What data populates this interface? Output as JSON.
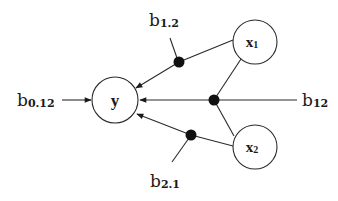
{
  "diagram": {
    "type": "path-diagram",
    "nodes": [
      {
        "id": "y",
        "label": "y",
        "cx": 115,
        "cy": 100,
        "r": 23
      },
      {
        "id": "x1",
        "label": "x",
        "sub": "1",
        "cx": 255,
        "cy": 42,
        "r": 22
      },
      {
        "id": "x2",
        "label": "x",
        "sub": "2",
        "cx": 255,
        "cy": 147,
        "r": 22
      }
    ],
    "coefficients": [
      {
        "id": "b0_12",
        "label": "b",
        "sub": "0.12"
      },
      {
        "id": "b1_2",
        "label": "b",
        "sub": "1.2"
      },
      {
        "id": "b12",
        "label": "b",
        "sub": "12"
      },
      {
        "id": "b2_1",
        "label": "b",
        "sub": "2.1"
      }
    ],
    "colors": {
      "stroke": "#2a2a2a",
      "dot": "#111111",
      "background": "#ffffff"
    }
  }
}
